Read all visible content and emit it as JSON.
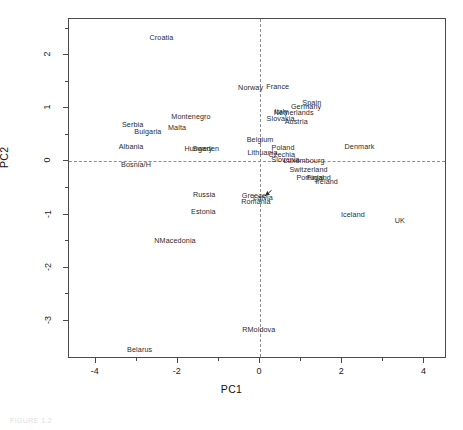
{
  "figure": {
    "caption": "FIGURE 1.2"
  },
  "axes": {
    "xlabel": "PC1",
    "ylabel": "PC2",
    "x_ticks": [
      -4,
      -2,
      0,
      2,
      4
    ],
    "x_tick_labels": [
      "-4",
      "-2",
      "0",
      "2",
      "4"
    ],
    "x_minor_ticks": [
      -3,
      -1,
      1,
      3
    ],
    "y_ticks": [
      2,
      1,
      0,
      -1,
      -2,
      -3
    ],
    "y_tick_labels": [
      "2",
      "1",
      "0",
      "-1",
      "-2",
      "-3"
    ],
    "y_minor_ticks": [
      2.5,
      1.5,
      0.5,
      -0.5,
      -1.5,
      -2.5
    ],
    "xlim": [
      -4.65,
      4.55
    ],
    "ylim": [
      -3.72,
      2.68
    ],
    "frame": true,
    "grid": false,
    "reference_lines": {
      "x": 0,
      "y": 0,
      "style": "dashed",
      "color": "#8e8e8e"
    }
  },
  "chart_data": {
    "type": "scatter",
    "title": "",
    "subtitle": "",
    "xlabel": "PC1",
    "ylabel": "PC2",
    "xlim": [
      -4.65,
      4.55
    ],
    "ylim": [
      -3.72,
      2.68
    ],
    "grid": false,
    "legend": "none",
    "point_marker": "text-label",
    "annotations": [
      {
        "label": "Latvia",
        "arrow_from": [
          0.28,
          -0.47
        ],
        "arrow_to": [
          0.07,
          -0.69
        ]
      }
    ],
    "points": [
      {
        "label": "Croatia",
        "x": -2.4,
        "y": 2.33
      },
      {
        "label": "Norway",
        "x": -0.23,
        "y": 1.39
      },
      {
        "label": "France",
        "x": 0.43,
        "y": 1.4
      },
      {
        "label": "Spain",
        "x": 1.26,
        "y": 1.1
      },
      {
        "label": "Germany",
        "x": 1.12,
        "y": 1.02
      },
      {
        "label": "Italy",
        "x": 0.52,
        "y": 0.93
      },
      {
        "label": "Netherlands",
        "x": 0.82,
        "y": 0.91
      },
      {
        "label": "Slovakia",
        "x": 0.5,
        "y": 0.8
      },
      {
        "label": "Austria",
        "x": 0.88,
        "y": 0.75
      },
      {
        "label": "Montenegro",
        "x": -1.68,
        "y": 0.83
      },
      {
        "label": "Serbia",
        "x": -3.1,
        "y": 0.68
      },
      {
        "label": "Malta",
        "x": -2.02,
        "y": 0.63
      },
      {
        "label": "Bulgaria",
        "x": -2.73,
        "y": 0.55
      },
      {
        "label": "Belgium",
        "x": 0.0,
        "y": 0.4
      },
      {
        "label": "Albania",
        "x": -3.14,
        "y": 0.27
      },
      {
        "label": "Hungary",
        "x": -1.5,
        "y": 0.24
      },
      {
        "label": "Sweden",
        "x": -1.32,
        "y": 0.23
      },
      {
        "label": "Poland",
        "x": 0.56,
        "y": 0.25
      },
      {
        "label": "Denmark",
        "x": 2.42,
        "y": 0.27
      },
      {
        "label": "Lithuania",
        "x": 0.06,
        "y": 0.15
      },
      {
        "label": "Czechia",
        "x": 0.53,
        "y": 0.12
      },
      {
        "label": "Slovenia",
        "x": 0.62,
        "y": 0.02
      },
      {
        "label": "Luxembourg",
        "x": 1.07,
        "y": 0.01
      },
      {
        "label": "Bosnia/H",
        "x": -3.02,
        "y": -0.07
      },
      {
        "label": "Switzerland",
        "x": 1.18,
        "y": -0.16
      },
      {
        "label": "Portugal",
        "x": 1.22,
        "y": -0.31
      },
      {
        "label": "Finland",
        "x": 1.43,
        "y": -0.31
      },
      {
        "label": "Ireland",
        "x": 1.62,
        "y": -0.38
      },
      {
        "label": "Latvia",
        "x": 0.07,
        "y": -0.69
      },
      {
        "label": "Russia",
        "x": -1.36,
        "y": -0.63
      },
      {
        "label": "Greece",
        "x": -0.15,
        "y": -0.66
      },
      {
        "label": "Romania",
        "x": -0.1,
        "y": -0.76
      },
      {
        "label": "Estonia",
        "x": -1.38,
        "y": -0.95
      },
      {
        "label": "Iceland",
        "x": 2.26,
        "y": -1.0
      },
      {
        "label": "UK",
        "x": 3.4,
        "y": -1.12
      },
      {
        "label": "NMacedonia",
        "x": -2.07,
        "y": -1.5
      },
      {
        "label": "RMoldova",
        "x": -0.03,
        "y": -3.18
      },
      {
        "label": "Belarus",
        "x": -2.93,
        "y": -3.55
      }
    ]
  }
}
